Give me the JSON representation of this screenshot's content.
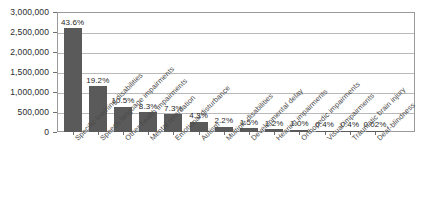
{
  "chart_data": {
    "type": "bar",
    "title": "",
    "subtitle": "",
    "xlabel": "",
    "ylabel": "",
    "ylim": [
      0,
      3000000
    ],
    "ytick_labels": [
      "3,000,000",
      "2,500,000",
      "2,000,000",
      "1,500,000",
      "1,000,000",
      "500,000",
      "0"
    ],
    "ytick_values": [
      3000000,
      2500000,
      2000000,
      1500000,
      1000000,
      500000,
      0
    ],
    "grid": true,
    "legend": "none",
    "orientation": "vertical",
    "bar_color": "#5a5a5a",
    "categories": [
      "Specific learning disabilities",
      "Speech language impairments",
      "Other health impairments",
      "Mental retardation",
      "Emotional disturbance",
      "Autism",
      "Multiple disabilities",
      "Developmental delay",
      "Hearing impairments",
      "Orthopedic impairments",
      "Visual impairments",
      "Traumatic brain injury",
      "Deaf-blindness"
    ],
    "values": [
      2600000,
      1150000,
      630000,
      490000,
      440000,
      260000,
      130000,
      90000,
      72000,
      60000,
      25000,
      25000,
      1200
    ],
    "data_labels": [
      "43.6%",
      "19.2%",
      "10.5%",
      "8.3%",
      "7.3%",
      "4.3%",
      "2.2%",
      "1.5%",
      "1.2%",
      "1.0%",
      "0.4%",
      "0.4%",
      "0.02%"
    ],
    "percentages": [
      43.6,
      19.2,
      10.5,
      8.3,
      7.3,
      4.3,
      2.2,
      1.5,
      1.2,
      1.0,
      0.4,
      0.4,
      0.02
    ]
  }
}
